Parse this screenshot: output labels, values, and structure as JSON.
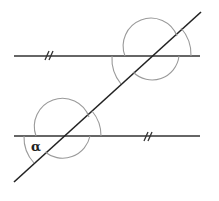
{
  "diagram": {
    "type": "parallel-lines-transversal",
    "angle_label": "α",
    "parallel_marks": [
      "//",
      "//"
    ],
    "colors": {
      "lines": "#2b2b2b",
      "arcs": "#9a9a9a",
      "background": "#ffffff"
    }
  }
}
